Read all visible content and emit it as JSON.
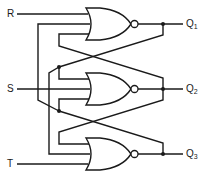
{
  "diagram": {
    "type": "logic-circuit",
    "inputs": [
      {
        "id": "R",
        "label": "R"
      },
      {
        "id": "S",
        "label": "S"
      },
      {
        "id": "T",
        "label": "T"
      }
    ],
    "outputs": [
      {
        "id": "Q1",
        "label": "Q",
        "sub": "1"
      },
      {
        "id": "Q2",
        "label": "Q",
        "sub": "2"
      },
      {
        "id": "Q3",
        "label": "Q",
        "sub": "3"
      }
    ],
    "gates": [
      {
        "id": "gate-1",
        "type": "NOR",
        "output": "Q1"
      },
      {
        "id": "gate-2",
        "type": "NOR",
        "output": "Q2"
      },
      {
        "id": "gate-3",
        "type": "NOR",
        "output": "Q3"
      }
    ],
    "colors": {
      "line": "#1a1a1a",
      "background": "#ffffff"
    }
  }
}
